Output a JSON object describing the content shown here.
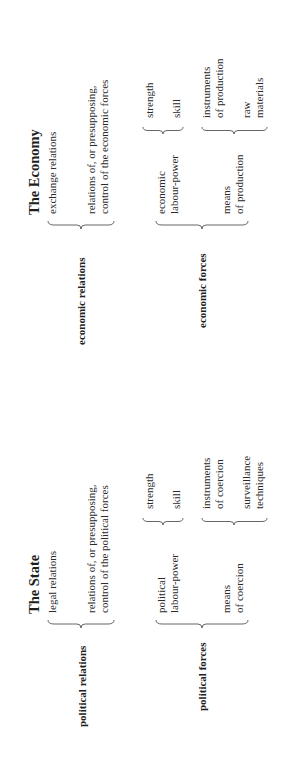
{
  "orientation": "rotated-90-ccw",
  "economy": {
    "title": "The Economy",
    "relations": {
      "label": "economic relations",
      "items": [
        "exchange relations",
        "relations of, or presupposing,",
        "control of the economic forces"
      ]
    },
    "forces": {
      "label": "economic forces",
      "labour_power": {
        "line1": "economic",
        "line2": "labour-power",
        "items": [
          "strength",
          "skill"
        ]
      },
      "means": {
        "line1": "means",
        "line2": "of production",
        "items": [
          {
            "line1": "instruments",
            "line2": "of production"
          },
          {
            "line1": "raw",
            "line2": "materials"
          }
        ]
      }
    }
  },
  "state": {
    "title": "The State",
    "relations": {
      "label": "political relations",
      "items": [
        "legal relations",
        "relations of, or presupposing,",
        "control of the political forces"
      ]
    },
    "forces": {
      "label": "political forces",
      "labour_power": {
        "line1": "political",
        "line2": "labour-power",
        "items": [
          "strength",
          "skill"
        ]
      },
      "means": {
        "line1": "means",
        "line2": "of coercion",
        "items": [
          {
            "line1": "instruments",
            "line2": "of coercion"
          },
          {
            "line1": "surveillance",
            "line2": "techniques"
          }
        ]
      }
    }
  }
}
